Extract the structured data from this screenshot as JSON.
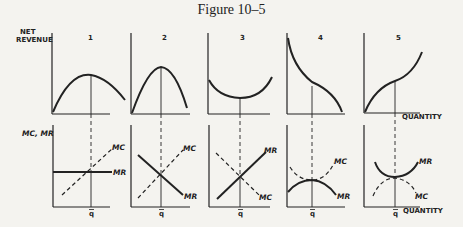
{
  "figure": {
    "title": "Figure 10–5",
    "top_ylabel": [
      "NET",
      "REVENUE"
    ],
    "bottom_ylabel": "MC, MR",
    "xlabel": "QUANTITY",
    "q_label": "q",
    "panels": [
      {
        "number": "1",
        "top_curve": "concave-max",
        "bottom": {
          "mc": "MC",
          "mr": "MR"
        }
      },
      {
        "number": "2",
        "top_curve": "concave-max-steep",
        "bottom": {
          "mc": "MC",
          "mr": "MR"
        }
      },
      {
        "number": "3",
        "top_curve": "convex-min",
        "bottom": {
          "mc": "MC",
          "mr": "MR"
        }
      },
      {
        "number": "4",
        "top_curve": "inflection-decreasing",
        "bottom": {
          "mc": "MC",
          "mr": "MR"
        }
      },
      {
        "number": "5",
        "top_curve": "inflection-increasing",
        "bottom": {
          "mc": "MC",
          "mr": "MR"
        }
      }
    ]
  }
}
